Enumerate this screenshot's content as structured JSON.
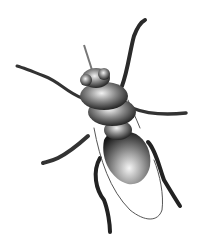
{
  "image": {
    "subject": "insect",
    "description": "Grayscale 3D-rendered fly-like insect viewed from above on white background",
    "background_color": "#ffffff",
    "body_dark": "#1a1a1a",
    "body_mid": "#6e6e6e",
    "body_light": "#e6e6e6"
  }
}
